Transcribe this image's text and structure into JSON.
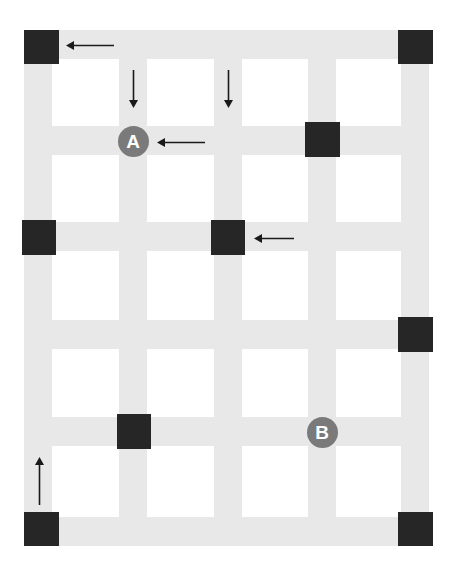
{
  "diagram": {
    "canvas": {
      "width": 454,
      "height": 574
    },
    "colors": {
      "background": "#ffffff",
      "street": "#e8e8e8",
      "block_marker": "#262626",
      "node_fill": "#7a7a7a",
      "node_text": "#ffffff",
      "arrow": "#1a1a1a"
    },
    "streets_vertical": [
      {
        "name": "avenue-1",
        "x": 24,
        "y": 30,
        "width": 28,
        "height": 516
      },
      {
        "name": "avenue-2",
        "x": 119,
        "y": 30,
        "width": 28,
        "height": 516
      },
      {
        "name": "avenue-3",
        "x": 214,
        "y": 30,
        "width": 28,
        "height": 516
      },
      {
        "name": "avenue-4",
        "x": 308,
        "y": 30,
        "width": 28,
        "height": 516
      },
      {
        "name": "avenue-5",
        "x": 401,
        "y": 30,
        "width": 28,
        "height": 516
      }
    ],
    "streets_horizontal": [
      {
        "name": "street-1",
        "x": 24,
        "y": 30,
        "width": 405,
        "height": 29
      },
      {
        "name": "street-2",
        "x": 24,
        "y": 126,
        "width": 405,
        "height": 29
      },
      {
        "name": "street-3",
        "x": 24,
        "y": 222,
        "width": 405,
        "height": 29
      },
      {
        "name": "street-4",
        "x": 24,
        "y": 320,
        "width": 405,
        "height": 29
      },
      {
        "name": "street-5",
        "x": 24,
        "y": 417,
        "width": 405,
        "height": 29
      },
      {
        "name": "street-6",
        "x": 24,
        "y": 517,
        "width": 405,
        "height": 29
      }
    ],
    "block_markers": [
      {
        "id": "marker-1",
        "label": "",
        "x": 24,
        "y": 30,
        "width": 35,
        "height": 34
      },
      {
        "id": "marker-2",
        "label": "",
        "x": 398,
        "y": 30,
        "width": 35,
        "height": 34
      },
      {
        "id": "marker-3",
        "label": "",
        "x": 305,
        "y": 122,
        "width": 35,
        "height": 35
      },
      {
        "id": "marker-4",
        "label": "",
        "x": 22,
        "y": 220,
        "width": 34,
        "height": 35
      },
      {
        "id": "marker-5",
        "label": "",
        "x": 211,
        "y": 220,
        "width": 34,
        "height": 35
      },
      {
        "id": "marker-6",
        "label": "",
        "x": 398,
        "y": 317,
        "width": 35,
        "height": 35
      },
      {
        "id": "marker-7",
        "label": "",
        "x": 117,
        "y": 414,
        "width": 34,
        "height": 35
      },
      {
        "id": "marker-8",
        "label": "",
        "x": 24,
        "y": 512,
        "width": 35,
        "height": 34
      },
      {
        "id": "marker-9",
        "label": "",
        "x": 398,
        "y": 512,
        "width": 35,
        "height": 34
      }
    ],
    "nodes": [
      {
        "id": "node-a",
        "label": "A",
        "cx": 133,
        "cy": 141
      },
      {
        "id": "node-b",
        "label": "B",
        "cx": 322,
        "cy": 432
      }
    ],
    "arrows": [
      {
        "id": "arrow-top-west",
        "direction": "left",
        "x": 66,
        "y": 39,
        "length": 48
      },
      {
        "id": "arrow-col2-south",
        "direction": "down",
        "x": 127,
        "y": 70,
        "length": 38
      },
      {
        "id": "arrow-col4-south",
        "direction": "down",
        "x": 222,
        "y": 70,
        "length": 38
      },
      {
        "id": "arrow-rowa-west",
        "direction": "left",
        "x": 157,
        "y": 136,
        "length": 48
      },
      {
        "id": "arrow-row3-west",
        "direction": "left",
        "x": 254,
        "y": 232,
        "length": 40
      },
      {
        "id": "arrow-bottom-north",
        "direction": "up",
        "x": 33,
        "y": 457,
        "length": 48
      }
    ]
  }
}
